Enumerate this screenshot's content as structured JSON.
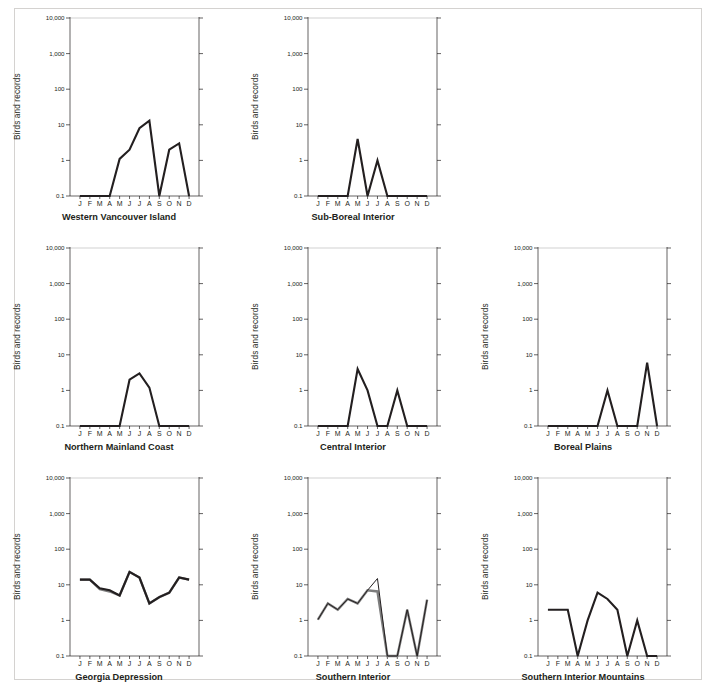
{
  "figure": {
    "y_axis_label": "Birds and records",
    "y_tick_labels": [
      "10,000",
      "1,000",
      "100",
      "10",
      "1",
      "0.1"
    ],
    "y_tick_values": [
      10000,
      1000,
      100,
      10,
      1,
      0.1
    ],
    "x_tick_labels": [
      "J",
      "F",
      "M",
      "A",
      "M",
      "J",
      "J",
      "A",
      "S",
      "O",
      "N",
      "D"
    ],
    "colors": {
      "primary_line": "#231f20",
      "secondary_line": "#7d7d7d",
      "gridline": "#bdbdbd",
      "frame": "#d4d2d0",
      "background": "#ffffff"
    }
  },
  "chart_data": [
    {
      "type": "line",
      "title": "Western Vancouver Island",
      "xlabel": "",
      "ylabel": "Birds and records",
      "x": [
        "J",
        "F",
        "M",
        "A",
        "M",
        "J",
        "J",
        "A",
        "S",
        "O",
        "N",
        "D"
      ],
      "ylim": [
        0.1,
        10000
      ],
      "yscale": "log",
      "grid": "top-only",
      "series": [
        {
          "name": "Birds and records",
          "style": "primary",
          "values": [
            0.1,
            0.1,
            0.1,
            0.1,
            1.1,
            2.0,
            8.0,
            13.0,
            0.1,
            2.0,
            3.0,
            0.1
          ]
        }
      ]
    },
    {
      "type": "line",
      "title": "Sub-Boreal Interior",
      "xlabel": "",
      "ylabel": "Birds and records",
      "x": [
        "J",
        "F",
        "M",
        "A",
        "M",
        "J",
        "J",
        "A",
        "S",
        "O",
        "N",
        "D"
      ],
      "ylim": [
        0.1,
        10000
      ],
      "yscale": "log",
      "grid": "top-only",
      "series": [
        {
          "name": "Birds and records",
          "style": "primary",
          "values": [
            0.1,
            0.1,
            0.1,
            0.1,
            4.0,
            0.1,
            1.0,
            0.1,
            0.1,
            0.1,
            0.1,
            0.1
          ]
        }
      ]
    },
    {
      "type": "line",
      "title": "",
      "xlabel": "",
      "ylabel": "",
      "x": [
        "J",
        "F",
        "M",
        "A",
        "M",
        "J",
        "J",
        "A",
        "S",
        "O",
        "N",
        "D"
      ],
      "ylim": [
        0.1,
        10000
      ],
      "yscale": "log",
      "grid": "none",
      "empty": true,
      "series": []
    },
    {
      "type": "line",
      "title": "Northern Mainland Coast",
      "xlabel": "",
      "ylabel": "Birds and records",
      "x": [
        "J",
        "F",
        "M",
        "A",
        "M",
        "J",
        "J",
        "A",
        "S",
        "O",
        "N",
        "D"
      ],
      "ylim": [
        0.1,
        10000
      ],
      "yscale": "log",
      "grid": "top-only",
      "series": [
        {
          "name": "Birds and records",
          "style": "primary",
          "values": [
            0.1,
            0.1,
            0.1,
            0.1,
            0.1,
            2.0,
            3.0,
            1.2,
            0.1,
            0.1,
            0.1,
            0.1
          ]
        }
      ]
    },
    {
      "type": "line",
      "title": "Central Interior",
      "xlabel": "",
      "ylabel": "Birds and records",
      "x": [
        "J",
        "F",
        "M",
        "A",
        "M",
        "J",
        "J",
        "A",
        "S",
        "O",
        "N",
        "D"
      ],
      "ylim": [
        0.1,
        10000
      ],
      "yscale": "log",
      "grid": "top-only",
      "series": [
        {
          "name": "Birds and records",
          "style": "primary",
          "values": [
            0.1,
            0.1,
            0.1,
            0.1,
            4.0,
            1.0,
            0.1,
            0.1,
            1.0,
            0.1,
            0.1,
            0.1
          ]
        }
      ]
    },
    {
      "type": "line",
      "title": "Boreal Plains",
      "xlabel": "",
      "ylabel": "Birds and records",
      "x": [
        "J",
        "F",
        "M",
        "A",
        "M",
        "J",
        "J",
        "A",
        "S",
        "O",
        "N",
        "D"
      ],
      "ylim": [
        0.1,
        10000
      ],
      "yscale": "log",
      "grid": "top-only",
      "series": [
        {
          "name": "Birds and records",
          "style": "primary",
          "values": [
            0.1,
            0.1,
            0.1,
            0.1,
            0.1,
            0.1,
            1.0,
            0.1,
            0.1,
            0.1,
            6.0,
            0.1
          ]
        }
      ]
    },
    {
      "type": "line",
      "title": "Georgia Depression",
      "xlabel": "",
      "ylabel": "Birds and records",
      "x": [
        "J",
        "F",
        "M",
        "A",
        "M",
        "J",
        "J",
        "A",
        "S",
        "O",
        "N",
        "D"
      ],
      "ylim": [
        0.1,
        10000
      ],
      "yscale": "log",
      "grid": "top-only",
      "series": [
        {
          "name": "Records",
          "style": "secondary",
          "values": [
            14.0,
            14.0,
            7.5,
            6.5,
            5.0,
            23.0,
            16.0,
            3.0,
            4.5,
            6.0,
            16.0,
            14.0
          ]
        },
        {
          "name": "Birds",
          "style": "primary",
          "values": [
            14.0,
            14.0,
            8.0,
            7.0,
            5.0,
            23.0,
            16.0,
            3.0,
            4.5,
            6.0,
            16.0,
            14.0
          ]
        }
      ]
    },
    {
      "type": "line",
      "title": "Southern Interior",
      "xlabel": "",
      "ylabel": "Birds and records",
      "x": [
        "J",
        "F",
        "M",
        "A",
        "M",
        "J",
        "J",
        "A",
        "S",
        "O",
        "N",
        "D"
      ],
      "ylim": [
        0.1,
        10000
      ],
      "yscale": "log",
      "grid": "top-only",
      "series": [
        {
          "name": "Records",
          "style": "secondary",
          "values": [
            1.05,
            3.0,
            2.0,
            4.0,
            3.0,
            7.0,
            6.5,
            0.1,
            0.1,
            2.0,
            0.1,
            3.8
          ]
        },
        {
          "name": "Birds",
          "style": "primary-thin",
          "values": [
            1.05,
            3.0,
            2.0,
            4.0,
            3.0,
            7.0,
            15.0,
            0.1,
            0.1,
            2.0,
            0.1,
            3.8
          ]
        }
      ]
    },
    {
      "type": "line",
      "title": "Southern Interior Mountains",
      "xlabel": "",
      "ylabel": "Birds and records",
      "x": [
        "J",
        "F",
        "M",
        "A",
        "M",
        "J",
        "J",
        "A",
        "S",
        "O",
        "N",
        "D"
      ],
      "ylim": [
        0.1,
        10000
      ],
      "yscale": "log",
      "grid": "top-only",
      "series": [
        {
          "name": "Birds and records",
          "style": "primary",
          "values": [
            2.0,
            2.0,
            2.0,
            0.1,
            1.0,
            6.0,
            4.0,
            2.0,
            0.1,
            1.0,
            0.1,
            0.1
          ]
        }
      ]
    }
  ]
}
